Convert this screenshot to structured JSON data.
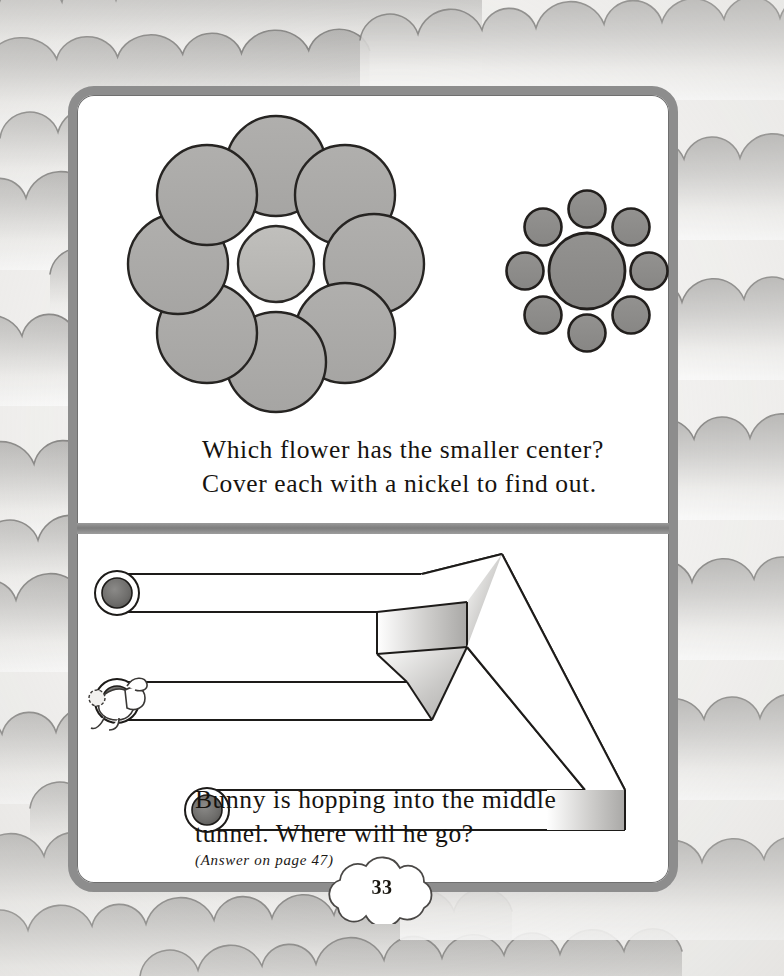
{
  "page": {
    "number": "33",
    "background_pattern": "hand-drawn-scalloped-clouds",
    "frame_color": "#8d8d8d",
    "paper_color": "#ffffff"
  },
  "puzzles": [
    {
      "id": "flower-centers",
      "type": "ebbinghaus-illusion",
      "caption_line_1": "Which flower has the smaller center?",
      "caption_line_2": "Cover each with a nickel to find out.",
      "figures": [
        {
          "name": "large-flower",
          "petal_count": 8,
          "petal_radius": 50,
          "petal_color": "#abaaa8",
          "center_radius": 38,
          "center_color": "#bab9b6",
          "center_x": 267,
          "center_y": 255,
          "petal_orbit_radius": 98
        },
        {
          "name": "small-flower",
          "petal_count": 8,
          "petal_radius": 18,
          "petal_color": "#8e8d8b",
          "center_radius": 38,
          "center_color": "#8e8d8b",
          "center_x": 578,
          "center_y": 262,
          "petal_orbit_radius": 62
        }
      ]
    },
    {
      "id": "bunny-tunnel",
      "type": "impossible-trident-illusion",
      "caption_line_1": "Bunny is hopping into the middle",
      "caption_line_2": "tunnel. Where will he go?",
      "answer_note": "(Answer on page 47)",
      "figure": {
        "name": "impossible-tunnel",
        "tunnel_openings": 3,
        "opening_ring_color": "#ffffff",
        "opening_bore_color": "#6e6d6b",
        "prong_shade_color": "#b9b8b6",
        "outline_color": "#1d1b19",
        "character": "bunny"
      }
    }
  ],
  "colors": {
    "ink": "#16130f",
    "frame": "#8d8d8d",
    "petal_large": "#abaaa8",
    "center_large": "#bab9b6",
    "petal_small": "#8e8d8b",
    "center_small": "#8e8d8b",
    "cloud_shade": "#b2b1af"
  }
}
